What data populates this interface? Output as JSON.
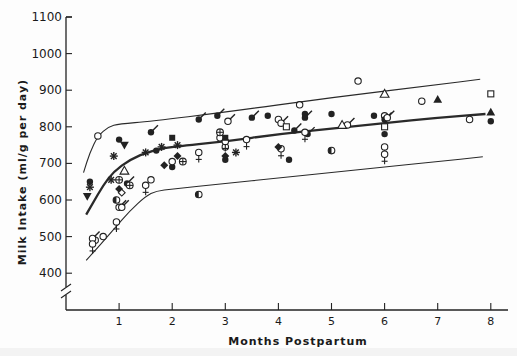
{
  "chart_data": {
    "type": "scatter",
    "title": "",
    "xlabel": "Months Postpartum",
    "ylabel": "Milk Intake (ml/g per day)",
    "xlim": [
      0,
      8.3
    ],
    "ylim": [
      400,
      1100
    ],
    "x_ticks": [
      "1",
      "2",
      "3",
      "4",
      "5",
      "6",
      "7",
      "8"
    ],
    "y_ticks": [
      "400",
      "500",
      "600",
      "700",
      "800",
      "900",
      "1000",
      "1100"
    ],
    "y_axis_break": true,
    "grid": false,
    "legend": null,
    "reference_curves": [
      {
        "name": "upper",
        "style": "thin",
        "points": [
          [
            0.33,
            675
          ],
          [
            0.45,
            730
          ],
          [
            0.6,
            775
          ],
          [
            0.8,
            800
          ],
          [
            1.0,
            808
          ],
          [
            1.6,
            815
          ],
          [
            3,
            840
          ],
          [
            5,
            880
          ],
          [
            7,
            915
          ],
          [
            7.8,
            930
          ]
        ]
      },
      {
        "name": "mean",
        "style": "thick",
        "points": [
          [
            0.38,
            560
          ],
          [
            0.5,
            590
          ],
          [
            0.7,
            640
          ],
          [
            0.9,
            678
          ],
          [
            1.2,
            710
          ],
          [
            1.6,
            735
          ],
          [
            2,
            745
          ],
          [
            3,
            760
          ],
          [
            4,
            780
          ],
          [
            5,
            795
          ],
          [
            6,
            810
          ],
          [
            7,
            825
          ],
          [
            7.9,
            835
          ]
        ]
      },
      {
        "name": "lower",
        "style": "thin",
        "points": [
          [
            0.38,
            435
          ],
          [
            0.6,
            470
          ],
          [
            0.9,
            520
          ],
          [
            1.2,
            570
          ],
          [
            1.5,
            610
          ],
          [
            1.7,
            625
          ],
          [
            2,
            630
          ],
          [
            3,
            645
          ],
          [
            4,
            660
          ],
          [
            5,
            675
          ],
          [
            6,
            690
          ],
          [
            7,
            705
          ],
          [
            7.85,
            718
          ]
        ]
      }
    ],
    "series": [
      {
        "name": "filled-circle",
        "marker": "●",
        "points": [
          [
            0.45,
            650
          ],
          [
            1.0,
            765
          ],
          [
            1.7,
            735
          ],
          [
            2.0,
            690
          ],
          [
            3.0,
            710
          ],
          [
            4.2,
            710
          ],
          [
            5.0,
            835
          ],
          [
            5.8,
            830
          ],
          [
            6.0,
            780
          ],
          [
            8.0,
            815
          ],
          [
            4.5,
            835
          ],
          [
            3.8,
            830
          ]
        ]
      },
      {
        "name": "open-circle",
        "marker": "○",
        "points": [
          [
            0.6,
            775
          ],
          [
            0.55,
            490
          ],
          [
            0.7,
            500
          ],
          [
            1.6,
            655
          ],
          [
            2.0,
            705
          ],
          [
            2.9,
            770
          ],
          [
            3.0,
            745
          ],
          [
            4.0,
            820
          ],
          [
            4.4,
            860
          ],
          [
            5.5,
            925
          ],
          [
            6.0,
            830
          ],
          [
            6.7,
            870
          ],
          [
            7.6,
            820
          ]
        ]
      },
      {
        "name": "filled-circle-with-stroke",
        "marker": "●/",
        "points": [
          [
            1.6,
            785
          ],
          [
            2.5,
            820
          ],
          [
            3.5,
            825
          ],
          [
            4.3,
            790
          ],
          [
            4.5,
            825
          ],
          [
            6.0,
            820
          ],
          [
            1.15,
            645
          ],
          [
            2.85,
            830
          ],
          [
            4.55,
            780
          ]
        ]
      },
      {
        "name": "open-circle-with-stroke",
        "marker": "○/",
        "points": [
          [
            0.5,
            495
          ],
          [
            1.0,
            580
          ],
          [
            1.05,
            580
          ],
          [
            3.05,
            815
          ],
          [
            4.05,
            810
          ],
          [
            5.3,
            805
          ],
          [
            6.05,
            825
          ]
        ]
      },
      {
        "name": "female-symbol",
        "marker": "♀",
        "points": [
          [
            0.5,
            480
          ],
          [
            0.95,
            540
          ],
          [
            1.5,
            640
          ],
          [
            2.5,
            730
          ],
          [
            3.0,
            760
          ],
          [
            3.4,
            765
          ],
          [
            4.05,
            740
          ],
          [
            4.5,
            785
          ],
          [
            6.0,
            745
          ],
          [
            6.0,
            725
          ]
        ]
      },
      {
        "name": "open-triangle",
        "marker": "△",
        "points": [
          [
            1.1,
            680
          ],
          [
            5.2,
            805
          ],
          [
            6.0,
            890
          ]
        ]
      },
      {
        "name": "filled-triangle",
        "marker": "▲",
        "points": [
          [
            7.0,
            875
          ],
          [
            8.0,
            840
          ]
        ]
      },
      {
        "name": "filled-inverted-triangle",
        "marker": "▼",
        "points": [
          [
            0.4,
            610
          ],
          [
            1.1,
            750
          ]
        ]
      },
      {
        "name": "filled-diamond",
        "marker": "◆",
        "points": [
          [
            1.0,
            630
          ],
          [
            2.1,
            720
          ],
          [
            3.0,
            720
          ],
          [
            4.0,
            745
          ],
          [
            1.85,
            695
          ]
        ]
      },
      {
        "name": "open-diamond",
        "marker": "◇",
        "points": [
          [
            1.05,
            620
          ]
        ]
      },
      {
        "name": "open-square",
        "marker": "□",
        "points": [
          [
            4.15,
            800
          ],
          [
            6.0,
            800
          ],
          [
            8.0,
            890
          ]
        ]
      },
      {
        "name": "filled-square",
        "marker": "■",
        "points": [
          [
            2.0,
            770
          ],
          [
            3.0,
            770
          ]
        ]
      },
      {
        "name": "asterisk",
        "marker": "✱",
        "points": [
          [
            0.45,
            635
          ],
          [
            0.9,
            720
          ],
          [
            1.5,
            730
          ],
          [
            1.8,
            745
          ],
          [
            2.1,
            750
          ],
          [
            3.2,
            730
          ],
          [
            0.85,
            655
          ]
        ]
      },
      {
        "name": "circled-plus",
        "marker": "⊕",
        "points": [
          [
            1.0,
            655
          ],
          [
            2.2,
            705
          ],
          [
            2.9,
            785
          ],
          [
            1.2,
            640
          ]
        ]
      },
      {
        "name": "half-filled-circle",
        "marker": "◐",
        "points": [
          [
            0.95,
            600
          ],
          [
            2.5,
            615
          ],
          [
            5.0,
            735
          ]
        ]
      }
    ]
  },
  "labels": {
    "y_axis_title": "Milk Intake (ml/g per day)",
    "x_axis_title": "Months Postpartum"
  }
}
